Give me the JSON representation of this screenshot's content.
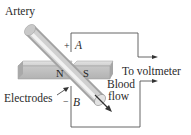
{
  "diagram": {
    "labels": {
      "artery": "Artery",
      "electrodes": "Electrodes",
      "to_voltmeter": "To voltmeter",
      "blood": "Blood",
      "flow": "flow",
      "north_pole": "N",
      "south_pole": "S",
      "electrode_a": "A",
      "electrode_b": "B",
      "plus_sign": "+",
      "minus_sign": "−"
    },
    "colors": {
      "wire": "#4a4a4a",
      "magnet_top": "#d6d6d6",
      "magnet_front": "#bcbcbc",
      "artery_light": "#eeeeee",
      "artery_dark": "#a8a8a8",
      "text": "#2a2a2a"
    }
  }
}
